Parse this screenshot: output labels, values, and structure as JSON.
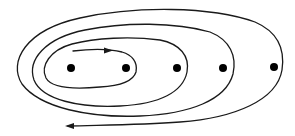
{
  "diagram": {
    "description": "Expanding spiral trajectory winding around a row of five points",
    "colors": {
      "background": "#ffffff",
      "stroke": "#1a1a1a",
      "dot": "#000000"
    },
    "points": [
      {
        "id": "p1",
        "cx": 71,
        "cy": 68,
        "r": 4
      },
      {
        "id": "p2",
        "cx": 126,
        "cy": 68,
        "r": 4
      },
      {
        "id": "p3",
        "cx": 177,
        "cy": 68,
        "r": 4
      },
      {
        "id": "p4",
        "cx": 223,
        "cy": 68,
        "r": 4
      },
      {
        "id": "p5",
        "cx": 274,
        "cy": 67,
        "r": 4
      }
    ],
    "spiral": {
      "start_arrow": "right",
      "end_arrow": "left",
      "loops": 4
    }
  }
}
